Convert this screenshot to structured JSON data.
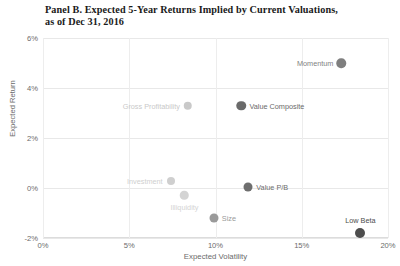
{
  "chart_data": {
    "type": "scatter",
    "title": "Panel B. Expected 5-Year Returns Implied by Current Valuations,\nas of Dec 31, 2016",
    "xlabel": "Expected Volatility",
    "ylabel": "Expected Return",
    "xlim": [
      0,
      20
    ],
    "ylim": [
      -2,
      6
    ],
    "xticks": [
      "0%",
      "5%",
      "10%",
      "15%",
      "20%"
    ],
    "xtick_values": [
      0,
      5,
      10,
      15,
      20
    ],
    "yticks": [
      "6%",
      "4%",
      "2%",
      "0%",
      "-2%"
    ],
    "ytick_values": [
      6,
      4,
      2,
      0,
      -2
    ],
    "grid": true,
    "legend": "none",
    "points": [
      {
        "name": "Momentum",
        "x": 17.3,
        "y": 5.0,
        "color": "#7f7f7f",
        "size": 9.5,
        "label_pos": "left"
      },
      {
        "name": "Value Composite",
        "x": 11.5,
        "y": 3.3,
        "color": "#6a6a6a",
        "size": 9.5,
        "label_pos": "right"
      },
      {
        "name": "Gross Profitability",
        "x": 8.4,
        "y": 3.3,
        "color": "#c9c9c9",
        "size": 8.5,
        "label_pos": "left"
      },
      {
        "name": "Investment",
        "x": 7.4,
        "y": 0.28,
        "color": "#cfcfcf",
        "size": 8.0,
        "label_pos": "left"
      },
      {
        "name": "Illiquidity",
        "x": 8.2,
        "y": -0.28,
        "color": "#d4d4d4",
        "size": 8.5,
        "label_pos": "below"
      },
      {
        "name": "Value P/B",
        "x": 11.9,
        "y": 0.05,
        "color": "#6e6e6e",
        "size": 9.0,
        "label_pos": "right"
      },
      {
        "name": "Size",
        "x": 9.9,
        "y": -1.2,
        "color": "#9a9a9a",
        "size": 9.0,
        "label_pos": "right"
      },
      {
        "name": "Low Beta",
        "x": 18.4,
        "y": -1.79,
        "color": "#4d4d4d",
        "size": 10.0,
        "label_pos": "above"
      }
    ]
  },
  "colors": {
    "gridline": "#e8e8e8",
    "text": "#6b6b6b",
    "title": "#1a1a1a"
  }
}
